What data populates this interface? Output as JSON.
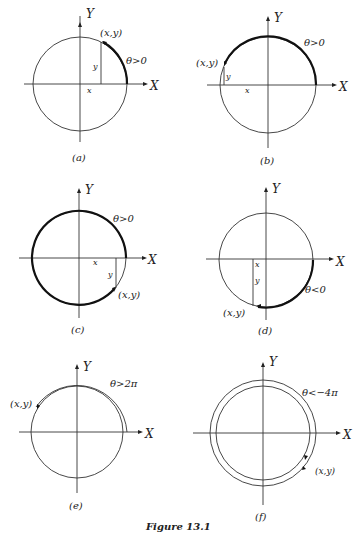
{
  "figure": {
    "caption": "Figure 13.1",
    "axis_labels": {
      "x": "X",
      "y": "Y"
    },
    "panels": [
      {
        "id": "a",
        "label": "(a)",
        "point_label": "(x,y)",
        "x_label": "x",
        "y_label": "y",
        "angle_label": "θ>0"
      },
      {
        "id": "b",
        "label": "(b)",
        "point_label": "(x,y)",
        "x_label": "x",
        "y_label": "y",
        "angle_label": "θ>0"
      },
      {
        "id": "c",
        "label": "(c)",
        "point_label": "(x,y)",
        "x_label": "x",
        "y_label": "y",
        "angle_label": "θ>0"
      },
      {
        "id": "d",
        "label": "(d)",
        "point_label": "(x,y)",
        "x_label": "x",
        "y_label": "y",
        "angle_label": "θ<0"
      },
      {
        "id": "e",
        "label": "(e)",
        "point_label": "(x,y)",
        "angle_label": "θ>2π"
      },
      {
        "id": "f",
        "label": "(f)",
        "point_label": "(x,y)",
        "angle_label": "θ<−4π"
      }
    ]
  }
}
